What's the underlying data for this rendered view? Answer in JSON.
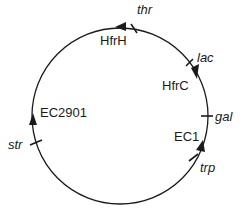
{
  "diagram": {
    "type": "circular-chromosome-map",
    "circle": {
      "cx": 120,
      "cy": 116,
      "r": 88,
      "stroke": "#1a1a1a"
    },
    "genes": [
      {
        "label": "thr",
        "tick": [
          131,
          24,
          137,
          33
        ],
        "text": [
          137,
          14
        ]
      },
      {
        "label": "lac",
        "tick": [
          186,
          66,
          193,
          59
        ],
        "text": [
          197,
          62
        ]
      },
      {
        "label": "gal",
        "tick": [
          201,
          116,
          213,
          116
        ],
        "text": [
          215,
          121
        ]
      },
      {
        "label": "trp",
        "tick": [
          189,
          161,
          198,
          154
        ],
        "text": [
          200,
          172
        ]
      },
      {
        "label": "str",
        "tick": [
          30,
          145,
          42,
          140
        ],
        "text": [
          8,
          149
        ]
      }
    ],
    "hfr_strains": [
      {
        "label": "HfrH",
        "arrow": "M115,27 L126,22 L126,31 Z",
        "text": [
          100,
          45
        ]
      },
      {
        "label": "HfrC",
        "arrow": "M197,79 L191,68 L199,64 Z",
        "text": [
          162,
          90
        ]
      },
      {
        "label": "EC1",
        "arrow": "M203,140 L205,152 L196,150 Z",
        "text": [
          174,
          141
        ]
      },
      {
        "label": "EC2901",
        "arrow": "M33,113 L29,125 L37,125 Z",
        "text": [
          40,
          117
        ]
      }
    ]
  }
}
